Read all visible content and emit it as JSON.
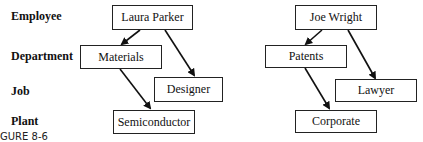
{
  "row_labels": [
    "Employee",
    "Department",
    "Job",
    "Plant"
  ],
  "trees": [
    {
      "employee": "Laura Parker",
      "department": "Materials",
      "job": "Designer",
      "plant": "Semiconductor"
    },
    {
      "employee": "Joe Wright",
      "department": "Patents",
      "job": "Lawyer",
      "plant": "Corporate"
    }
  ],
  "caption": "GURE 8-6"
}
